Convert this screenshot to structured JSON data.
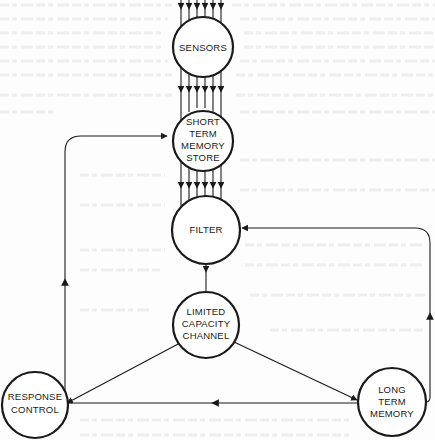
{
  "diagram": {
    "type": "information-processing-flow",
    "colors": {
      "ink": "#1a1a1a",
      "paper": "#fdfdfd",
      "bleed": "#ececec"
    },
    "nodes": [
      {
        "id": "sensors",
        "label_lines": [
          "SENSORS"
        ]
      },
      {
        "id": "stm",
        "label_lines": [
          "SHORT",
          "TERM",
          "MEMORY",
          "STORE"
        ]
      },
      {
        "id": "filter",
        "label_lines": [
          "FILTER"
        ]
      },
      {
        "id": "lcc",
        "label_lines": [
          "LIMITED",
          "CAPACITY",
          "CHANNEL"
        ]
      },
      {
        "id": "response",
        "label_lines": [
          "RESPONSE",
          "CONTROL"
        ]
      },
      {
        "id": "ltm",
        "label_lines": [
          "LONG",
          "TERM",
          "MEMORY"
        ]
      }
    ],
    "edges": [
      {
        "from": "input",
        "to": "sensors",
        "count": 6
      },
      {
        "from": "sensors",
        "to": "stm",
        "count": 6
      },
      {
        "from": "stm",
        "to": "filter",
        "count": 6
      },
      {
        "from": "filter",
        "to": "lcc",
        "count": 1
      },
      {
        "from": "lcc",
        "to": "response",
        "count": 1
      },
      {
        "from": "lcc",
        "to": "ltm",
        "count": 1
      },
      {
        "from": "ltm",
        "to": "response",
        "count": 1
      },
      {
        "from": "response",
        "to": "stm",
        "count": 1
      },
      {
        "from": "ltm",
        "to": "filter",
        "count": 1
      }
    ]
  }
}
